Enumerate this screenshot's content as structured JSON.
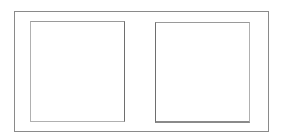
{
  "diagram": {
    "outer_frame": {
      "border_color": "#8a8a8a"
    },
    "panels": [
      {
        "id": "left",
        "label": ""
      },
      {
        "id": "right",
        "label": ""
      }
    ],
    "colors": {
      "background": "#ffffff",
      "border_dark": "#6e6e6e",
      "border_light": "#b0b0b0"
    }
  }
}
